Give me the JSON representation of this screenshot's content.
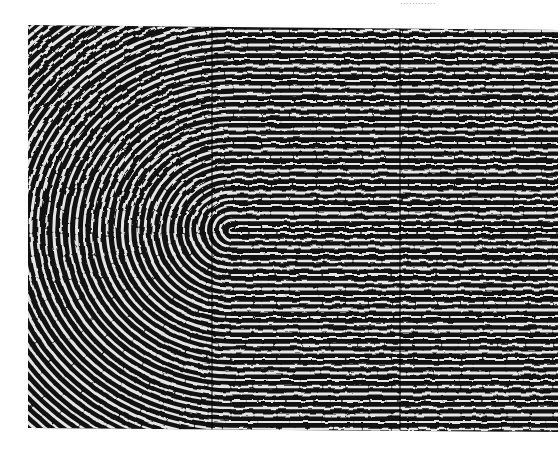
{
  "caption": {
    "text": "............"
  },
  "image": {
    "subject": "fingerprint-loop",
    "left": 28,
    "top": 25,
    "right": 558,
    "bottom": 430,
    "core": {
      "x": 232,
      "y": 230
    },
    "ridge_spacing": 7,
    "ridge_color": "#111111",
    "valley_color": "#e6e6e6",
    "vertical_lines_x": [
      212,
      400
    ]
  }
}
